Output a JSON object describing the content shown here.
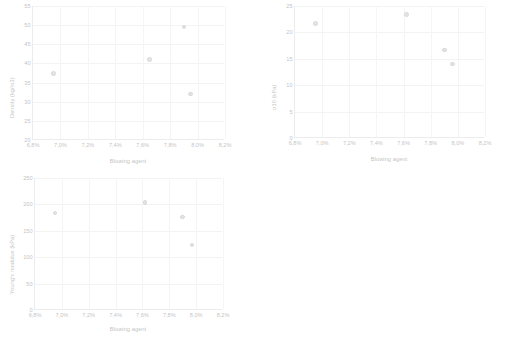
{
  "page": {
    "background": "#ffffff",
    "marker_fill": "#bfbfbf",
    "marker_stroke": "#a6a6a6",
    "grid_color": "#e3e3e3",
    "axis_color": "#d2d2d2",
    "text_color": "#6f6f6f"
  },
  "chart_data": [
    {
      "id": "density",
      "type": "scatter",
      "title": "",
      "xlabel": "Blowing agent",
      "ylabel": "Density (kg/m3)",
      "xlim": [
        6.8,
        8.2
      ],
      "ylim": [
        20,
        55
      ],
      "xticks": [
        "6,8%",
        "7,0%",
        "7,2%",
        "7,4%",
        "7,6%",
        "7,8%",
        "8,0%",
        "8,2%"
      ],
      "xtick_values": [
        6.8,
        7.0,
        7.2,
        7.4,
        7.6,
        7.8,
        8.0,
        8.2
      ],
      "yticks": [
        "20",
        "25",
        "30",
        "35",
        "40",
        "45",
        "50",
        "55"
      ],
      "ytick_values": [
        20,
        25,
        30,
        35,
        40,
        45,
        50,
        55
      ],
      "grid": "both",
      "legend": "none",
      "x": [
        6.95,
        7.65,
        7.9,
        7.95
      ],
      "y": [
        37.4,
        41.0,
        49.5,
        32.0
      ]
    },
    {
      "id": "sigma10",
      "type": "scatter",
      "title": "",
      "xlabel": "Blowing agent",
      "ylabel": "σ10 (kPa)",
      "xlim": [
        6.8,
        8.2
      ],
      "ylim": [
        0,
        25
      ],
      "xticks": [
        "6,8%",
        "7,0%",
        "7,2%",
        "7,4%",
        "7,6%",
        "7,8%",
        "8,0%",
        "8,2%"
      ],
      "xtick_values": [
        6.8,
        7.0,
        7.2,
        7.4,
        7.6,
        7.8,
        8.0,
        8.2
      ],
      "yticks": [
        "0",
        "5",
        "10",
        "15",
        "20",
        "25"
      ],
      "ytick_values": [
        0,
        5,
        10,
        15,
        20,
        25
      ],
      "grid": "both",
      "legend": "none",
      "x": [
        6.95,
        7.62,
        7.9,
        7.96
      ],
      "y": [
        21.7,
        23.4,
        16.7,
        14.0
      ]
    },
    {
      "id": "youngs",
      "type": "scatter",
      "title": "",
      "xlabel": "Blowing agent",
      "ylabel": "Young's modulus (kPa)",
      "xlim": [
        6.8,
        8.2
      ],
      "ylim": [
        0,
        250
      ],
      "xticks": [
        "6,8%",
        "7,0%",
        "7,2%",
        "7,4%",
        "7,6%",
        "7,8%",
        "8,0%",
        "8,2%"
      ],
      "xtick_values": [
        6.8,
        7.0,
        7.2,
        7.4,
        7.6,
        7.8,
        8.0,
        8.2
      ],
      "yticks": [
        "0",
        "50",
        "100",
        "150",
        "200",
        "250"
      ],
      "ytick_values": [
        0,
        50,
        100,
        150,
        200,
        250
      ],
      "grid": "both",
      "legend": "none",
      "x": [
        6.95,
        7.62,
        7.9,
        7.97
      ],
      "y": [
        184,
        204,
        176,
        123
      ]
    }
  ]
}
